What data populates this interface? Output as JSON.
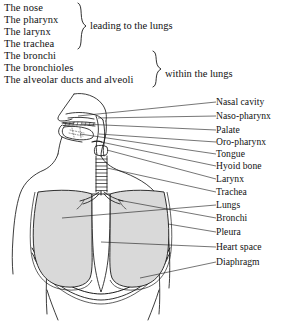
{
  "header": {
    "groups": [
      {
        "id": "group-upper-airway",
        "lines": [
          "The nose",
          "The pharynx",
          "The larynx",
          "The trachea"
        ],
        "caption": "leading to the lungs"
      },
      {
        "id": "group-lower-airway",
        "lines": [
          "The bronchi",
          "The bronchioles",
          "The alveolar ducts and alveoli"
        ],
        "caption": "within the lungs"
      }
    ]
  },
  "diagram": {
    "labels": [
      {
        "text": "Nasal cavity",
        "y": 10,
        "lx": 0,
        "leader_from": [
          74,
          22
        ]
      },
      {
        "text": "Naso-pharynx",
        "y": 24,
        "lx": 0,
        "leader_from": [
          88,
          30
        ]
      },
      {
        "text": "Palate",
        "y": 38,
        "lx": 0,
        "leader_from": [
          78,
          38
        ]
      },
      {
        "text": "Oro-pharynx",
        "y": 50,
        "lx": 0,
        "leader_from": [
          96,
          44
        ]
      },
      {
        "text": "Tongue",
        "y": 62,
        "lx": 0,
        "leader_from": [
          78,
          48
        ]
      },
      {
        "text": "Hyoid bone",
        "y": 74,
        "lx": 0,
        "leader_from": [
          100,
          56
        ]
      },
      {
        "text": "Larynx",
        "y": 87,
        "lx": 0,
        "leader_from": [
          106,
          64
        ]
      },
      {
        "text": "Trachea",
        "y": 100,
        "lx": 0,
        "leader_from": [
          108,
          78
        ]
      },
      {
        "text": "Lungs",
        "y": 113,
        "lx": 0,
        "leader_from": [
          80,
          120
        ]
      },
      {
        "text": "Bronchi",
        "y": 126,
        "lx": 0,
        "leader_from": [
          112,
          100
        ]
      },
      {
        "text": "Pleura",
        "y": 140,
        "lx": 0,
        "leader_from": [
          150,
          128
        ]
      },
      {
        "text": "Heart space",
        "y": 155,
        "lx": 0,
        "leader_from": [
          108,
          140
        ]
      },
      {
        "text": "Diaphragm",
        "y": 170,
        "lx": 0,
        "leader_from": [
          140,
          172
        ]
      }
    ],
    "colors": {
      "ink": "#1a1a1a",
      "lung_fill": "#d9d9d9",
      "heart_space_fill": "#ffffff",
      "background": "#ffffff"
    }
  }
}
